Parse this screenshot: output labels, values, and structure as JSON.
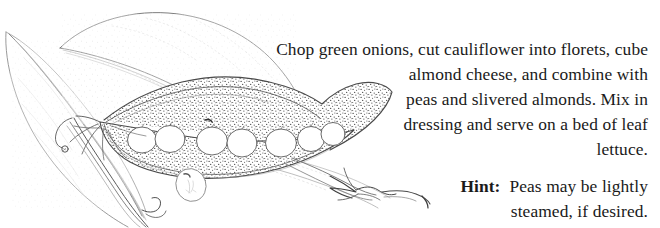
{
  "page": {
    "background_color": "#ffffff",
    "width": 660,
    "height": 228,
    "ink_color": "#1a1a1a",
    "line_art_color": "#555555"
  },
  "recipe": {
    "instructions": "Chop green onions, cut cauliflower into florets, cube almond cheese, and combine with peas and slivered almonds.  Mix in dressing and serve on a bed of leaf lettuce.",
    "lines": [
      "Chop green onions, cut cauliflower into florets, cube",
      "almond cheese, and combine with",
      "peas and slivered almonds.  Mix in",
      "dressing and serve on a bed of leaf",
      "lettuce."
    ],
    "alignment": "right"
  },
  "hint": {
    "label": "Hint:",
    "body": "Peas may be lightly steamed, if desired.",
    "lines": [
      "Peas may be lightly",
      "steamed, if desired."
    ],
    "alignment": "right"
  },
  "illustration": {
    "subject": "open pea pod with peas, pea leaves and tendrils",
    "style": "black and white stippled pen-and-ink line drawing",
    "pea_count_in_pod": 7,
    "detached_pea_count": 1,
    "leaf_count": 3,
    "elements": [
      "upper-leaf",
      "left-leaf",
      "lower-leaf",
      "pea-pod",
      "pea-seeds",
      "detached-pea",
      "stem",
      "tendril",
      "sepals"
    ]
  }
}
